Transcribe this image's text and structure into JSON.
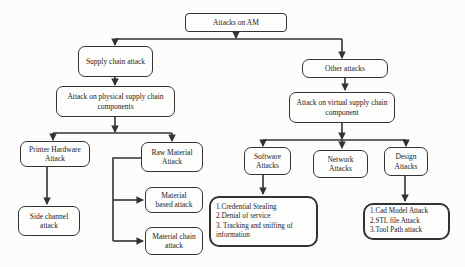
{
  "colors": {
    "border": "#333333",
    "text": "#1c1c1c",
    "background": "#fcfcfa"
  },
  "diagram": {
    "type": "flowchart",
    "root_label": "Attacks on AM",
    "nodes": {
      "attacks_on_am": {
        "label": "Attacks on AM"
      },
      "supply_chain": {
        "label": "Supply chain attack"
      },
      "physical_supply": {
        "label": "Attack on physical supply chain components"
      },
      "printer_hardware": {
        "label": "Printer Hardware Attack"
      },
      "side_channel": {
        "label": "Side channel attack"
      },
      "raw_material": {
        "label": "Raw Material Attack"
      },
      "material_based": {
        "label": "Material based attack"
      },
      "material_chain": {
        "label": "Material chain attack"
      },
      "other_attacks": {
        "label": "Other attacks"
      },
      "virtual_supply": {
        "label": "Attack on virtual supply chain component"
      },
      "software_attacks": {
        "label": "Software Attacks"
      },
      "network_attacks": {
        "label": "Network Attacks"
      },
      "design_attacks": {
        "label": "Design Attacks"
      },
      "software_details": {
        "items": [
          "1.Credential Stealing",
          "2.Denial of service",
          "3. Tracking and sniffing of information"
        ]
      },
      "design_details": {
        "items": [
          "1.Cad Model Attack",
          "2.STL file Attack",
          "3.Tool Path attack"
        ]
      }
    },
    "edges": [
      {
        "from": "attacks_on_am",
        "to": "supply_chain"
      },
      {
        "from": "attacks_on_am",
        "to": "other_attacks"
      },
      {
        "from": "supply_chain",
        "to": "physical_supply"
      },
      {
        "from": "physical_supply",
        "to": "printer_hardware"
      },
      {
        "from": "physical_supply",
        "to": "raw_material"
      },
      {
        "from": "printer_hardware",
        "to": "side_channel"
      },
      {
        "from": "raw_material",
        "to": "material_based"
      },
      {
        "from": "raw_material",
        "to": "material_chain"
      },
      {
        "from": "other_attacks",
        "to": "virtual_supply"
      },
      {
        "from": "virtual_supply",
        "to": "software_attacks"
      },
      {
        "from": "virtual_supply",
        "to": "network_attacks"
      },
      {
        "from": "virtual_supply",
        "to": "design_attacks"
      },
      {
        "from": "software_attacks",
        "to": "software_details"
      },
      {
        "from": "design_attacks",
        "to": "design_details"
      }
    ]
  }
}
